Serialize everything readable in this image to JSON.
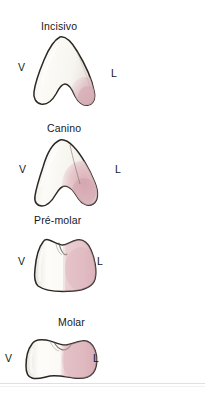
{
  "figure": {
    "caption_language": "pt-BR",
    "side_label_vestibular": "V",
    "side_label_lingual": "L",
    "background_color": "#ffffff",
    "enamel_color": "#fbfaf6",
    "lingual_shade_color": "#e7c9cd",
    "outline_color": "#2b2723",
    "rule_color": "#e8dcdd"
  },
  "teeth": [
    {
      "name": "incisivo",
      "title": "Incisivo",
      "vestibular": "V",
      "lingual": "L"
    },
    {
      "name": "canino",
      "title": "Canino",
      "vestibular": "V",
      "lingual": "L"
    },
    {
      "name": "pre-molar",
      "title": "Pré-molar",
      "vestibular": "V",
      "lingual": "L"
    },
    {
      "name": "molar",
      "title": "Molar",
      "vestibular": "V",
      "lingual": "L"
    }
  ]
}
